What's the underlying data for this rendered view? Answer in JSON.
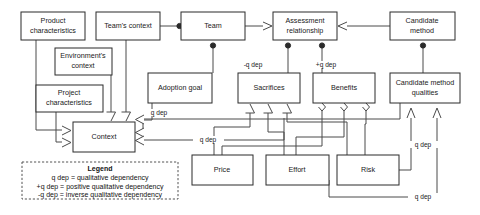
{
  "diagram": {
    "nodes": [
      {
        "id": "product-characteristics",
        "label": "Product\ncharacteristics",
        "line1": "Product",
        "line2": "characteristics",
        "x": 21,
        "y": 12,
        "w": 64,
        "h": 28
      },
      {
        "id": "teams-context",
        "label": "Team's context",
        "line1": "Team's context",
        "line2": "",
        "x": 96,
        "y": 12,
        "w": 64,
        "h": 28
      },
      {
        "id": "team",
        "label": "Team",
        "line1": "Team",
        "line2": "",
        "x": 181,
        "y": 12,
        "w": 64,
        "h": 28
      },
      {
        "id": "assessment-relationship",
        "label": "Assessment\nrelationship",
        "line1": "Assessment",
        "line2": "relationship",
        "x": 273,
        "y": 12,
        "w": 64,
        "h": 28
      },
      {
        "id": "candidate-method",
        "label": "Candidate\nmethod",
        "line1": "Candidate",
        "line2": "method",
        "x": 390,
        "y": 12,
        "w": 65,
        "h": 28
      },
      {
        "id": "environments-context",
        "label": "Environment's\ncontext",
        "line1": "Environment's",
        "line2": "context",
        "x": 55,
        "y": 48,
        "w": 57,
        "h": 27
      },
      {
        "id": "project-characteristics",
        "label": "Project\ncharacteristics",
        "line1": "Project",
        "line2": "characteristics",
        "x": 36,
        "y": 85,
        "w": 67,
        "h": 27
      },
      {
        "id": "adoption-goal",
        "label": "Adoption goal",
        "line1": "Adoption goal",
        "line2": "",
        "x": 148,
        "y": 73,
        "w": 64,
        "h": 30
      },
      {
        "id": "sacrifices",
        "label": "Sacrifices",
        "line1": "Sacrifices",
        "line2": "",
        "x": 238,
        "y": 73,
        "w": 62,
        "h": 30
      },
      {
        "id": "benefits",
        "label": "Benefits",
        "line1": "Benefits",
        "line2": "",
        "x": 313,
        "y": 73,
        "w": 62,
        "h": 30
      },
      {
        "id": "candidate-method-qualities",
        "label": "Candidate method\nqualities",
        "line1": "Candidate method",
        "line2": "qualities",
        "x": 390,
        "y": 73,
        "w": 70,
        "h": 30
      },
      {
        "id": "context",
        "label": "Context",
        "line1": "Context",
        "line2": "",
        "x": 73,
        "y": 122,
        "w": 62,
        "h": 30
      },
      {
        "id": "price",
        "label": "Price",
        "line1": "Price",
        "line2": "",
        "x": 192,
        "y": 155,
        "w": 61,
        "h": 30
      },
      {
        "id": "effort",
        "label": "Effort",
        "line1": "Effort",
        "line2": "",
        "x": 266,
        "y": 155,
        "w": 63,
        "h": 30
      },
      {
        "id": "risk",
        "label": "Risk",
        "line1": "Risk",
        "line2": "",
        "x": 337,
        "y": 155,
        "w": 62,
        "h": 30
      }
    ],
    "edge_labels": [
      {
        "id": "edge-label-sacrifices-assessment",
        "text": "-q dep",
        "x": 253,
        "y": 65
      },
      {
        "id": "edge-label-benefits-assessment",
        "text": "+q dep",
        "x": 326,
        "y": 65
      },
      {
        "id": "edge-label-adoption-context",
        "text": "q dep",
        "x": 158,
        "y": 113
      },
      {
        "id": "edge-label-sacrifices-context",
        "text": "q dep",
        "x": 206,
        "y": 133
      },
      {
        "id": "edge-label-risk-qualities",
        "text": "q dep",
        "x": 420,
        "y": 145
      },
      {
        "id": "edge-label-effort-qualities",
        "text": "q dep",
        "x": 420,
        "y": 195
      }
    ],
    "legend": {
      "title": "Legend",
      "lines": [
        "q dep = qualitative dependency",
        "+q dep = positive qualitative dependency",
        "-q dep = inverse qualitative dependency"
      ],
      "x": 22,
      "y": 162,
      "w": 156,
      "h": 37
    },
    "colors": {
      "box_stroke": "#2b2b2b",
      "line_stroke": "#4a4a4a",
      "text": "#1a1a1a",
      "background": "#ffffff",
      "legend_stroke": "#555555"
    }
  }
}
